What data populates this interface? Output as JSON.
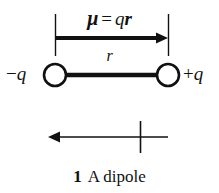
{
  "figure": {
    "title": "A dipole",
    "caption": {
      "number": "1",
      "text": "A dipole"
    },
    "moment_label": {
      "mu": "μ",
      "equals": "=",
      "charge": "q",
      "separation": "r",
      "full": "μ = qr"
    },
    "separation_label": "r",
    "charges": {
      "negative": {
        "sign": "−",
        "symbol": "q",
        "full": "−q"
      },
      "positive": {
        "sign": "+",
        "symbol": "q",
        "full": "+q"
      }
    },
    "colors": {
      "ink": "#111111",
      "background": "#ffffff"
    },
    "geometry": {
      "left_charge_x": 55,
      "right_charge_x": 168,
      "charge_y": 75,
      "charge_radius": 11,
      "moment_arrow_y": 38,
      "tick_top_y": 14,
      "tick_bottom_y": 56,
      "convention_arrow_y": 137,
      "convention_arrow_tip_x": 48,
      "convention_crossbar_x": 140
    }
  }
}
